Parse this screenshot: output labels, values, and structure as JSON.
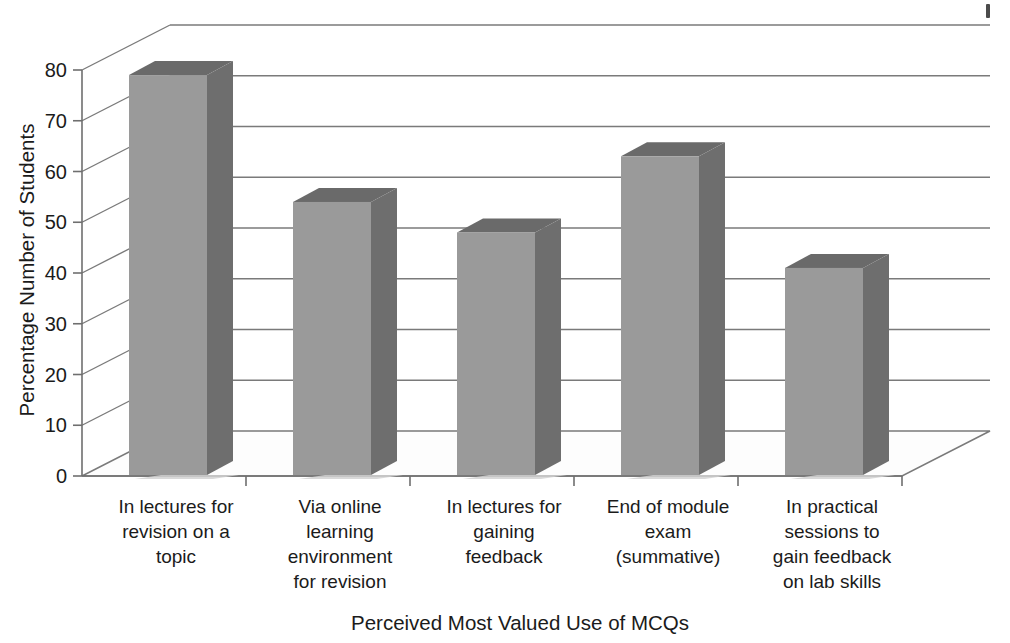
{
  "chart_data": {
    "type": "bar",
    "title": "",
    "subtitle": "",
    "xlabel": "Perceived Most Valued Use of MCQs",
    "ylabel": "Percentage Number of Students",
    "ylim": [
      0,
      80
    ],
    "ytick_step": 10,
    "yticks": [
      0,
      10,
      20,
      30,
      40,
      50,
      60,
      70,
      80
    ],
    "ytick_labels": [
      "0",
      "10",
      "20",
      "30",
      "40",
      "50",
      "60",
      "70",
      "80"
    ],
    "grid": true,
    "grid_axis": "y",
    "legend": false,
    "legend_position": "none",
    "style": "3d-column",
    "categories": [
      "In lectures for\nrevision on a\ntopic",
      "Via online\nlearning\nenvironment\nfor revision",
      "In lectures for\ngaining\nfeedback",
      "End of module\nexam\n(summative)",
      "In practical\nsessions to\ngain feedback\non lab skills"
    ],
    "values": [
      79,
      54,
      48,
      63,
      41
    ],
    "series": [
      {
        "name": "Percentage Number of Students",
        "values": [
          79,
          54,
          48,
          63,
          41
        ]
      }
    ],
    "colors": {
      "bar_front": "#9a9a9a",
      "bar_side": "#6e6e6e",
      "bar_top": "#6a6a6a",
      "grid": "#7a7a7a",
      "axis": "#6f6f6f",
      "text": "#1b1b1b",
      "background": "#ffffff",
      "floor": "#fdfdfd"
    }
  },
  "axes": {
    "y_title": "Percentage Number of Students",
    "x_title": "Perceived Most Valued Use of MCQs"
  },
  "category_labels": [
    {
      "line1": "In lectures for",
      "line2": "revision on a",
      "line3": "topic",
      "line4": ""
    },
    {
      "line1": "Via online",
      "line2": "learning",
      "line3": "environment",
      "line4": "for revision"
    },
    {
      "line1": "In lectures for",
      "line2": "gaining",
      "line3": "feedback",
      "line4": ""
    },
    {
      "line1": "End of module",
      "line2": "exam",
      "line3": "(summative)",
      "line4": ""
    },
    {
      "line1": "In practical",
      "line2": "sessions to",
      "line3": "gain feedback",
      "line4": "on lab skills"
    }
  ]
}
